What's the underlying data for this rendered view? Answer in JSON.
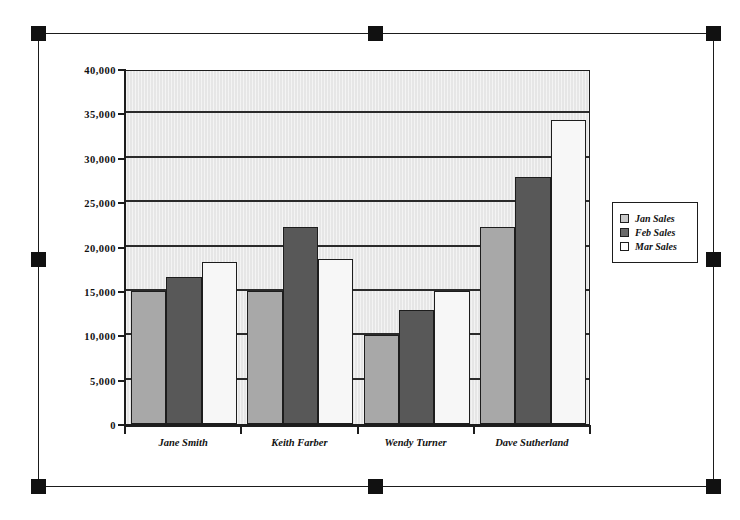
{
  "selection": {
    "handles": [
      {
        "name": "handle-top-left",
        "x": 31,
        "y": 26
      },
      {
        "name": "handle-top-center",
        "x": 368,
        "y": 26
      },
      {
        "name": "handle-top-right",
        "x": 706,
        "y": 26
      },
      {
        "name": "handle-middle-left",
        "x": 31,
        "y": 252
      },
      {
        "name": "handle-middle-right",
        "x": 706,
        "y": 252
      },
      {
        "name": "handle-bottom-left",
        "x": 31,
        "y": 479
      },
      {
        "name": "handle-bottom-center",
        "x": 368,
        "y": 479
      },
      {
        "name": "handle-bottom-right",
        "x": 706,
        "y": 479
      }
    ]
  },
  "colors": {
    "series_jan": "#a8a8a8",
    "series_feb": "#585858",
    "series_mar": "#f7f7f7",
    "plot_background": "#e6e6e6",
    "axis": "#1d1d1d",
    "gridline": "#2b2b2b"
  },
  "chart_data": {
    "type": "bar",
    "title": "",
    "xlabel": "",
    "ylabel": "",
    "ylim": [
      0,
      40000
    ],
    "ytick_values": [
      0,
      5000,
      10000,
      15000,
      20000,
      25000,
      30000,
      35000,
      40000
    ],
    "ytick_labels": [
      "0",
      "5,000",
      "10,000",
      "15,000",
      "20,000",
      "25,000",
      "30,000",
      "35,000",
      "40,000"
    ],
    "grid": true,
    "grid_axis": "y",
    "legend_position": "right",
    "categories": [
      "Jane Smith",
      "Keith Farber",
      "Wendy Turner",
      "Dave Sutherland"
    ],
    "series": [
      {
        "name": "Jan Sales",
        "values": [
          15000,
          15000,
          10000,
          22200
        ]
      },
      {
        "name": "Feb Sales",
        "values": [
          16600,
          22200,
          12900,
          27800
        ]
      },
      {
        "name": "Mar Sales",
        "values": [
          18200,
          18600,
          15000,
          34200
        ]
      }
    ]
  }
}
